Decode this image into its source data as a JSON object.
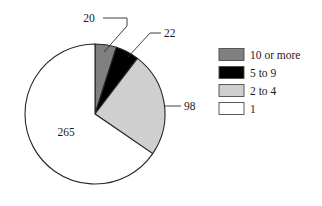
{
  "chart_data": {
    "type": "pie",
    "title": "",
    "categories": [
      "10 or more",
      "5 to 9",
      "2 to 4",
      "1"
    ],
    "values": [
      20,
      22,
      98,
      265
    ],
    "total": 405,
    "data_labels": [
      "20",
      "22",
      "98",
      "265"
    ],
    "colors": [
      "#808080",
      "#000000",
      "#cfcfcf",
      "#ffffff"
    ],
    "legend_position": "right",
    "start_angle_deg": -90,
    "direction": "clockwise",
    "grid": false,
    "xlabel": "",
    "ylabel": ""
  },
  "labels": {
    "slice_10_or_more": "20",
    "slice_5_to_9": "22",
    "slice_2_to_4": "98",
    "slice_1": "265"
  },
  "legend": {
    "items": [
      {
        "label": "10 or more",
        "color": "#808080",
        "value": 20
      },
      {
        "label": "5 to 9",
        "color": "#000000",
        "value": 22
      },
      {
        "label": "2 to 4",
        "color": "#cfcfcf",
        "value": 98
      },
      {
        "label": "1",
        "color": "#ffffff",
        "value": 265
      }
    ]
  },
  "geometry": {
    "center_x": 95,
    "center_y": 114,
    "radius": 70
  }
}
